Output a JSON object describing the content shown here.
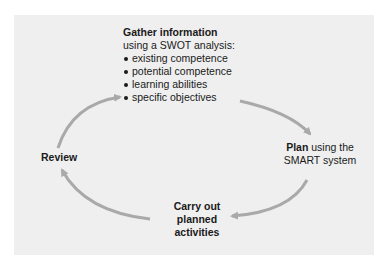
{
  "diagram": {
    "type": "cycle",
    "background": "#efefef",
    "arrow_color": "#a9a9a9",
    "nodes": {
      "gather": {
        "title": "Gather information",
        "subtitle": "using a SWOT analysis:",
        "bullets": [
          "existing competence",
          "potential competence",
          "learning abilities",
          "specific objectives"
        ]
      },
      "plan": {
        "bold": "Plan",
        "rest": " using the",
        "line2": "SMART system"
      },
      "carry": {
        "line1": "Carry out",
        "line2": "planned",
        "line3": "activities"
      },
      "review": {
        "label": "Review"
      }
    },
    "edges": [
      {
        "from": "gather",
        "to": "plan"
      },
      {
        "from": "plan",
        "to": "carry"
      },
      {
        "from": "carry",
        "to": "review"
      },
      {
        "from": "review",
        "to": "gather"
      }
    ]
  }
}
